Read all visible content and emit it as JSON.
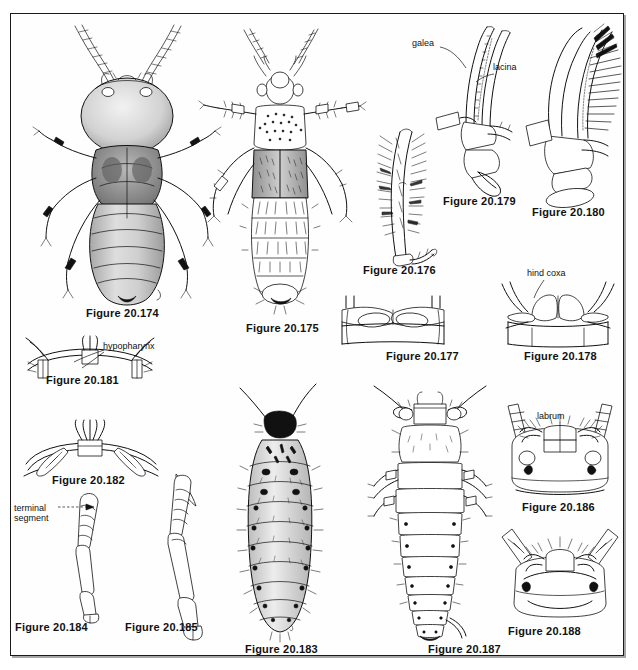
{
  "plate": {
    "kind": "scientific-illustration-plate",
    "subject": "Entomological line drawings of rove beetles and larvae (Coleoptera: Staphylinidae)",
    "background_color": "#ffffff",
    "ink_color": "#111111",
    "border_color": "#1a1a1a",
    "figure_count": 15
  },
  "figures": [
    {
      "id": "20.174",
      "caption": "Figure 20.174",
      "subject": "dorsal habitus of ant-like stone beetle, whole body",
      "caption_x": 86,
      "caption_y": 307,
      "art_x": 30,
      "art_y": 18,
      "art_w": 200,
      "art_h": 288,
      "annotations": []
    },
    {
      "id": "20.175",
      "caption": "Figure 20.175",
      "subject": "dorsal habitus of rove beetle, whole body",
      "caption_x": 246,
      "caption_y": 322,
      "art_x": 202,
      "art_y": 18,
      "art_w": 160,
      "art_h": 298,
      "annotations": []
    },
    {
      "id": "20.176",
      "caption": "Figure 20.176",
      "subject": "hairy maxillary lacinia bearing dense setae",
      "caption_x": 363,
      "caption_y": 264,
      "art_x": 366,
      "art_y": 124,
      "art_w": 62,
      "art_h": 136,
      "annotations": []
    },
    {
      "id": "20.179",
      "caption": "Figure 20.179",
      "subject": "maxilla with galea and lacinia, lateral view",
      "caption_x": 443,
      "caption_y": 195,
      "art_x": 432,
      "art_y": 26,
      "art_w": 90,
      "art_h": 165,
      "annotations": [
        {
          "text": "galea",
          "x": 412,
          "y": 38,
          "leader": "from-label-right-down"
        },
        {
          "text": "lacina",
          "x": 493,
          "y": 62,
          "leader": "from-label-left-down"
        }
      ]
    },
    {
      "id": "20.180",
      "caption": "Figure 20.180",
      "subject": "maxilla with comb-like fringe of setae, lateral view",
      "caption_x": 532,
      "caption_y": 206,
      "art_x": 524,
      "art_y": 26,
      "art_w": 92,
      "art_h": 175,
      "annotations": []
    },
    {
      "id": "20.177",
      "caption": "Figure 20.177",
      "subject": "hind coxae, ventral view, coxae not prominent",
      "caption_x": 386,
      "caption_y": 350,
      "art_x": 340,
      "art_y": 296,
      "art_w": 118,
      "art_h": 50,
      "annotations": []
    },
    {
      "id": "20.178",
      "caption": "Figure 20.178",
      "subject": "hind coxae, ventral view, coxae conical and prominent",
      "caption_x": 524,
      "caption_y": 350,
      "art_x": 492,
      "art_y": 282,
      "art_w": 126,
      "art_h": 62,
      "annotations": [
        {
          "text": "hind coxa",
          "x": 527,
          "y": 268,
          "leader": "from-label-down-left"
        }
      ]
    },
    {
      "id": "20.181",
      "caption": "Figure 20.181",
      "subject": "head underside showing hypopharynx between maxillae",
      "caption_x": 46,
      "caption_y": 374,
      "art_x": 22,
      "art_y": 334,
      "art_w": 130,
      "art_h": 36,
      "annotations": [
        {
          "text": "hypopharynx",
          "x": 103,
          "y": 341,
          "leader": "from-label-left-down"
        }
      ]
    },
    {
      "id": "20.182",
      "caption": "Figure 20.182",
      "subject": "head underside, hypopharynx with fringed lobes",
      "caption_x": 52,
      "caption_y": 474,
      "art_x": 20,
      "art_y": 416,
      "art_w": 140,
      "art_h": 56,
      "annotations": []
    },
    {
      "id": "20.184",
      "caption": "Figure 20.184",
      "subject": "hind leg with terminal tarsal segment labeled",
      "caption_x": 15,
      "caption_y": 621,
      "art_x": 68,
      "art_y": 492,
      "art_w": 54,
      "art_h": 126,
      "annotations": [
        {
          "text": "terminal",
          "x": 14,
          "y": 504,
          "leader": "dashed-right"
        },
        {
          "text": "segment",
          "x": 14,
          "y": 515,
          "leader": "none"
        }
      ]
    },
    {
      "id": "20.185",
      "caption": "Figure 20.185",
      "subject": "hind leg, elongate tarsus, lateral view",
      "caption_x": 125,
      "caption_y": 621,
      "art_x": 160,
      "art_y": 474,
      "art_w": 58,
      "art_h": 162,
      "annotations": []
    },
    {
      "id": "20.183",
      "caption": "Figure 20.183",
      "subject": "beetle larva, dorsal view, dark head capsule and spotted abdomen",
      "caption_x": 245,
      "caption_y": 643,
      "art_x": 232,
      "art_y": 382,
      "art_w": 100,
      "art_h": 255,
      "annotations": []
    },
    {
      "id": "20.187",
      "caption": "Figure 20.187",
      "subject": "beetle larva, dorsal view, broad overlapping tergites",
      "caption_x": 428,
      "caption_y": 643,
      "art_x": 366,
      "art_y": 384,
      "art_w": 120,
      "art_h": 252,
      "annotations": []
    },
    {
      "id": "20.186",
      "caption": "Figure 20.186",
      "subject": "larval head capsule, dorsal view, labrum labeled",
      "caption_x": 522,
      "caption_y": 501,
      "art_x": 494,
      "art_y": 402,
      "art_w": 122,
      "art_h": 96,
      "annotations": [
        {
          "text": "labrum",
          "x": 537,
          "y": 412,
          "leader": "vertical-down"
        }
      ]
    },
    {
      "id": "20.188",
      "caption": "Figure 20.188",
      "subject": "larval head capsule, dorsal view, rounded clypeus",
      "caption_x": 508,
      "caption_y": 625,
      "art_x": 494,
      "art_y": 527,
      "art_w": 122,
      "art_h": 94,
      "annotations": []
    }
  ],
  "label_texts": {
    "galea": "galea",
    "lacina": "lacina",
    "hind_coxa": "hind coxa",
    "hypopharynx": "hypopharynx",
    "terminal": "terminal",
    "segment": "segment",
    "labrum": "labrum"
  }
}
